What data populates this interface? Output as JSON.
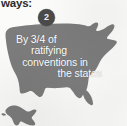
{
  "heading": {
    "fragment_text": "ways:"
  },
  "step": {
    "badge_number": "2",
    "badge_color": "#4a4a4a",
    "badge_text_color": "#f2f2f2"
  },
  "map": {
    "icon_name": "united-states-map",
    "fill_color": "#7c7c7c",
    "background_color": "#fbfbfa"
  },
  "caption": {
    "line_1": "By 3/4 of",
    "line_2": "ratifying",
    "line_3": "conventions in",
    "line_4": "the states",
    "text_color": "#fdfdfd"
  }
}
